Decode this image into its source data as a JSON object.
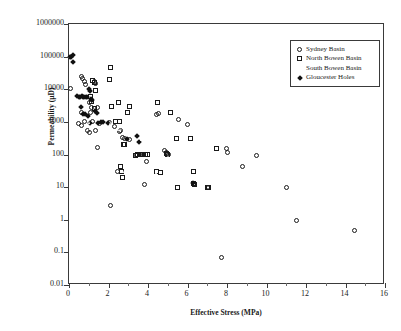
{
  "chart_data": {
    "type": "scatter",
    "title": "",
    "xlabel": "Effective Stress (MPa)",
    "ylabel": "Permeability (µD)",
    "xlim": [
      0,
      16
    ],
    "ylim": [
      0.01,
      1000000
    ],
    "yscale": "log",
    "xscale": "linear",
    "grid": false,
    "legend_position": "top-right",
    "xticks": [
      0,
      2,
      4,
      6,
      8,
      10,
      12,
      14,
      16
    ],
    "xtick_labels": [
      "0",
      "2",
      "4",
      "6",
      "8",
      "10",
      "12",
      "14",
      "16"
    ],
    "xminor_step": 1,
    "yticks": [
      0.01,
      0.1,
      1,
      10,
      100,
      1000,
      10000,
      100000,
      1000000
    ],
    "ytick_labels": [
      "0.01",
      "0.1",
      "1",
      "10",
      "100",
      "1000",
      "10000",
      "100000",
      "1000000"
    ],
    "series": [
      {
        "name": "Sydney Basin",
        "marker": "circle",
        "filled": false,
        "points": [
          [
            0.1,
            10500
          ],
          [
            0.65,
            25000
          ],
          [
            0.7,
            21000
          ],
          [
            0.78,
            17000
          ],
          [
            0.85,
            14000
          ],
          [
            0.62,
            2000
          ],
          [
            0.48,
            900
          ],
          [
            0.62,
            800
          ],
          [
            0.8,
            1000
          ],
          [
            1.1,
            2000
          ],
          [
            1.28,
            17000
          ],
          [
            1.32,
            15000
          ],
          [
            1.05,
            4000
          ],
          [
            1.12,
            2800
          ],
          [
            1.2,
            1050
          ],
          [
            1.45,
            2700
          ],
          [
            0.95,
            560
          ],
          [
            1.05,
            480
          ],
          [
            1.32,
            560
          ],
          [
            1.42,
            160
          ],
          [
            1.55,
            900
          ],
          [
            2.05,
            960
          ],
          [
            2.12,
            2.7
          ],
          [
            2.3,
            700
          ],
          [
            2.45,
            30
          ],
          [
            2.55,
            520
          ],
          [
            2.6,
            560
          ],
          [
            2.72,
            330
          ],
          [
            2.8,
            300
          ],
          [
            3.05,
            290
          ],
          [
            3.42,
            95
          ],
          [
            3.55,
            98
          ],
          [
            3.8,
            12
          ],
          [
            3.92,
            60
          ],
          [
            4.45,
            1700
          ],
          [
            4.52,
            1800
          ],
          [
            4.85,
            130
          ],
          [
            4.92,
            115
          ],
          [
            5.0,
            105
          ],
          [
            5.05,
            98
          ],
          [
            5.55,
            1200
          ],
          [
            6.0,
            840
          ],
          [
            6.3,
            12
          ],
          [
            7.0,
            10
          ],
          [
            7.05,
            10
          ],
          [
            7.7,
            0.07
          ],
          [
            7.95,
            150
          ],
          [
            8.05,
            115
          ],
          [
            8.8,
            42
          ],
          [
            9.5,
            95
          ],
          [
            11.0,
            9.5
          ],
          [
            11.5,
            0.97
          ],
          [
            14.45,
            0.47
          ]
        ]
      },
      {
        "name": "North Bowen Basin",
        "marker": "square",
        "filled": false,
        "points": [
          [
            1.2,
            18000
          ],
          [
            1.28,
            16000
          ],
          [
            1.35,
            9000
          ],
          [
            1.08,
            6000
          ],
          [
            1.15,
            4200
          ],
          [
            1.3,
            2600
          ],
          [
            2.1,
            48000
          ],
          [
            2.05,
            20000
          ],
          [
            2.15,
            2900
          ],
          [
            2.5,
            3900
          ],
          [
            2.35,
            1000
          ],
          [
            2.55,
            1000
          ],
          [
            2.6,
            44
          ],
          [
            2.68,
            30
          ],
          [
            2.7,
            20
          ],
          [
            2.78,
            200
          ],
          [
            2.82,
            200
          ],
          [
            3.05,
            2900
          ],
          [
            2.95,
            2000
          ],
          [
            3.35,
            95
          ],
          [
            3.48,
            98
          ],
          [
            3.6,
            100
          ],
          [
            3.72,
            100
          ],
          [
            3.85,
            100
          ],
          [
            3.95,
            100
          ],
          [
            4.5,
            4000
          ],
          [
            4.42,
            30
          ],
          [
            4.65,
            29
          ],
          [
            4.95,
            110
          ],
          [
            5.0,
            100
          ],
          [
            5.15,
            2000
          ],
          [
            5.45,
            300
          ],
          [
            5.5,
            10
          ],
          [
            6.15,
            300
          ],
          [
            6.3,
            30
          ],
          [
            6.3,
            13
          ],
          [
            6.35,
            12
          ],
          [
            7.0,
            10
          ],
          [
            7.08,
            10
          ],
          [
            7.45,
            150
          ]
        ]
      },
      {
        "name": "South Bowen Basin",
        "marker": "triangle",
        "filled": false,
        "points": [
          [
            0.95,
            3000
          ],
          [
            1.0,
            2900
          ],
          [
            1.05,
            1000
          ],
          [
            1.12,
            620
          ],
          [
            1.3,
            330
          ],
          [
            1.52,
            290
          ],
          [
            1.92,
            640
          ],
          [
            2.12,
            930
          ],
          [
            2.2,
            1000
          ],
          [
            2.55,
            600
          ],
          [
            2.65,
            600
          ],
          [
            2.85,
            30
          ],
          [
            2.95,
            29
          ],
          [
            3.12,
            6000
          ],
          [
            3.5,
            560
          ],
          [
            3.7,
            300
          ],
          [
            4.0,
            480
          ],
          [
            4.15,
            58
          ],
          [
            4.45,
            29
          ],
          [
            5.05,
            88
          ],
          [
            5.15,
            75
          ],
          [
            5.95,
            8
          ],
          [
            6.1,
            8
          ],
          [
            6.95,
            20
          ],
          [
            7.05,
            18
          ],
          [
            7.5,
            13
          ],
          [
            7.6,
            13
          ]
        ]
      },
      {
        "name": "Gloucester Holes",
        "marker": "diamond",
        "filled": true,
        "points": [
          [
            0.05,
            100000
          ],
          [
            0.12,
            97000
          ],
          [
            0.2,
            110000
          ],
          [
            0.22,
            70000
          ],
          [
            0.4,
            6000
          ],
          [
            0.5,
            5800
          ],
          [
            0.58,
            5900
          ],
          [
            0.65,
            6000
          ],
          [
            0.7,
            5900
          ],
          [
            0.78,
            5800
          ],
          [
            0.85,
            5600
          ],
          [
            0.92,
            5600
          ],
          [
            0.6,
            2900
          ],
          [
            0.72,
            1800
          ],
          [
            0.8,
            1700
          ],
          [
            1.0,
            10000
          ],
          [
            1.05,
            9000
          ],
          [
            1.12,
            5000
          ],
          [
            1.18,
            4800
          ],
          [
            1.3,
            2100
          ],
          [
            1.4,
            1900
          ],
          [
            1.45,
            900
          ],
          [
            1.05,
            900
          ],
          [
            0.95,
            1500
          ],
          [
            1.6,
            1000
          ],
          [
            1.7,
            990
          ],
          [
            1.95,
            900
          ],
          [
            2.95,
            300
          ],
          [
            3.42,
            380
          ],
          [
            3.55,
            250
          ],
          [
            6.3,
            13
          ]
        ]
      }
    ]
  },
  "legend": {
    "entries": [
      {
        "label": "Sydney Basin",
        "marker": "circle"
      },
      {
        "label": "North Bowen Basin",
        "marker": "square"
      },
      {
        "label": "South Bowen Basin",
        "marker": "triangle"
      },
      {
        "label": "Gloucester Holes",
        "marker": "diamond"
      }
    ]
  }
}
